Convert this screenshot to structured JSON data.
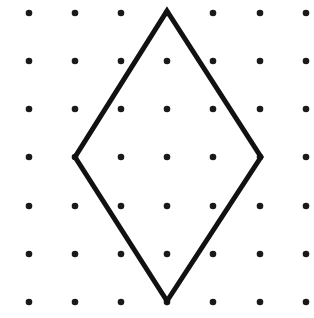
{
  "diagram": {
    "type": "dot-grid-with-rhombus",
    "background": "#ffffff",
    "dot_color": "#1a1a1a",
    "line_color": "#111111",
    "grid": {
      "columns_x": [
        29,
        75,
        121,
        167,
        213,
        260,
        306
      ],
      "rows_y": [
        13,
        61,
        109,
        157,
        206,
        254,
        302
      ],
      "dot_radius": 3.3
    },
    "shape": {
      "name": "rhombus",
      "vertices": [
        [
          167,
          11
        ],
        [
          261,
          157
        ],
        [
          167,
          301
        ],
        [
          75,
          157
        ]
      ],
      "stroke_width": 5
    }
  }
}
